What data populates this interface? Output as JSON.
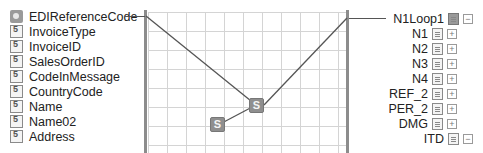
{
  "source_fields": [
    {
      "label": "EDIReferenceCode",
      "icon": "key-field-icon",
      "y": 16,
      "linked": true
    },
    {
      "label": "InvoiceType",
      "icon": "field-icon",
      "y": 31
    },
    {
      "label": "InvoiceID",
      "icon": "field-icon",
      "y": 46
    },
    {
      "label": "SalesOrderID",
      "icon": "field-icon",
      "y": 61
    },
    {
      "label": "CodeInMessage",
      "icon": "field-icon",
      "y": 76
    },
    {
      "label": "CountryCode",
      "icon": "field-icon",
      "y": 91
    },
    {
      "label": "Name",
      "icon": "field-icon",
      "y": 106
    },
    {
      "label": "Name02",
      "icon": "field-icon",
      "y": 121
    },
    {
      "label": "Address",
      "icon": "field-icon",
      "y": 136
    }
  ],
  "target_nodes": [
    {
      "label": "N1Loop1",
      "icon": "loop-record-icon",
      "toggle": "−",
      "toggle_name": "collapse-icon",
      "y": 18,
      "right": 10,
      "linked": true
    },
    {
      "label": "N1",
      "icon": "record-icon",
      "toggle": "+",
      "toggle_name": "expand-icon",
      "y": 33,
      "right": 26
    },
    {
      "label": "N2",
      "icon": "record-icon",
      "toggle": "+",
      "toggle_name": "expand-icon",
      "y": 48,
      "right": 26
    },
    {
      "label": "N3",
      "icon": "record-icon",
      "toggle": "+",
      "toggle_name": "expand-icon",
      "y": 63,
      "right": 26
    },
    {
      "label": "N4",
      "icon": "record-icon",
      "toggle": "+",
      "toggle_name": "expand-icon",
      "y": 78,
      "right": 26
    },
    {
      "label": "REF_2",
      "icon": "record-icon",
      "toggle": "+",
      "toggle_name": "expand-icon",
      "y": 93,
      "right": 26
    },
    {
      "label": "PER_2",
      "icon": "record-icon",
      "toggle": "+",
      "toggle_name": "expand-icon",
      "y": 108,
      "right": 26
    },
    {
      "label": "DMG",
      "icon": "record-icon",
      "toggle": "+",
      "toggle_name": "expand-icon",
      "y": 123,
      "right": 26
    },
    {
      "label": "ITD",
      "icon": "record-icon",
      "toggle": "−",
      "toggle_name": "collapse-icon",
      "y": 138,
      "right": 10
    }
  ],
  "functoids": [
    {
      "name": "string-functoid-1",
      "glyph": "S",
      "x": 249,
      "y": 98
    },
    {
      "name": "string-functoid-2",
      "glyph": "S",
      "x": 210,
      "y": 117
    }
  ],
  "links": [
    {
      "from": [
        146,
        16
      ],
      "to": [
        256,
        105
      ]
    },
    {
      "from": [
        347,
        18
      ],
      "to": [
        264,
        105
      ]
    },
    {
      "from": [
        256,
        105
      ],
      "to": [
        220,
        124
      ]
    }
  ],
  "colors": {
    "grid": "#d4d4d4",
    "bar": "#8c8c8c",
    "link": "#555555",
    "functoid": "#8f8f8f"
  }
}
